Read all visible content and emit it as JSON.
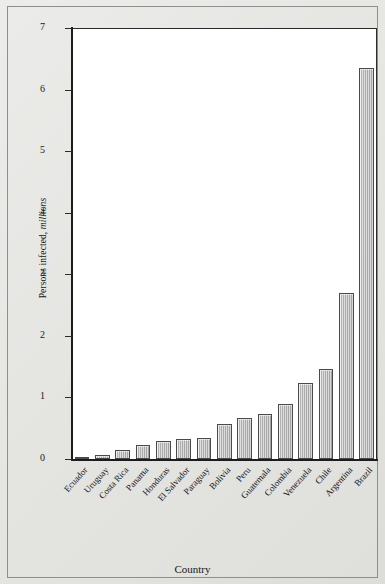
{
  "chart_data": {
    "type": "bar",
    "title": "",
    "xlabel": "Country",
    "ylabel": "Persons infected, millions",
    "ylabel_plain": "Persons infected,",
    "ylabel_italic": "millions",
    "ylim": [
      0,
      7
    ],
    "yticks": [
      0,
      1,
      2,
      3,
      4,
      5,
      6,
      7
    ],
    "ytick_labels": [
      "0",
      "1",
      "2",
      "3",
      "4",
      "5",
      "6",
      "7"
    ],
    "grid": false,
    "legend": "none",
    "orientation": "vertical",
    "bar_color": "#b4b4b4",
    "bar_edge_color": "#4a4a4a",
    "plot_background": "#ffffff",
    "figure_background": "#e6e6e3",
    "categories": [
      "Ecuador",
      "Uruguay",
      "Costa Rica",
      "Panama",
      "Honduras",
      "El Salvador",
      "Paraguay",
      "Bolivia",
      "Peru",
      "Guatemala",
      "Colombia",
      "Venezuela",
      "Chile",
      "Argentina",
      "Brazil"
    ],
    "values": [
      0.04,
      0.07,
      0.15,
      0.23,
      0.3,
      0.33,
      0.34,
      0.57,
      0.66,
      0.73,
      0.9,
      1.23,
      1.47,
      2.7,
      6.35
    ]
  }
}
